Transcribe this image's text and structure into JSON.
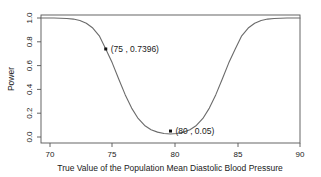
{
  "chart_data": {
    "type": "line",
    "title": "",
    "xlabel": "True Value of the Population Mean Diastolic Blood Pressure",
    "ylabel": "Power",
    "xlim": [
      70,
      90
    ],
    "ylim": [
      0.0,
      1.0
    ],
    "xticks": [
      70,
      75,
      80,
      85,
      90
    ],
    "xticklabels": [
      "70",
      "75",
      "80",
      "85",
      "90"
    ],
    "yticks": [
      0.0,
      0.2,
      0.4,
      0.6,
      0.8,
      1.0
    ],
    "yticklabels": [
      "0.0",
      "0.2",
      "0.4",
      "0.6",
      "0.8",
      "1.0"
    ],
    "grid": false,
    "legend": null,
    "series": [
      {
        "name": "power",
        "color": "#6b6b6b",
        "x": [
          70.0,
          70.5,
          71.0,
          71.5,
          72.0,
          72.5,
          73.0,
          73.5,
          74.0,
          74.5,
          75.0,
          75.5,
          76.0,
          76.5,
          77.0,
          77.5,
          78.0,
          78.5,
          79.0,
          79.5,
          80.0,
          80.5,
          81.0,
          81.5,
          82.0,
          82.5,
          83.0,
          83.5,
          84.0,
          84.5,
          85.0,
          85.5,
          86.0,
          86.5,
          87.0,
          87.5,
          88.0,
          88.5,
          89.0,
          89.5,
          90.0
        ],
        "y": [
          0.9999,
          0.9998,
          0.9994,
          0.9985,
          0.9962,
          0.9909,
          0.9793,
          0.9564,
          0.9155,
          0.8503,
          0.7396,
          0.6232,
          0.488,
          0.356,
          0.2428,
          0.1559,
          0.0968,
          0.0615,
          0.041,
          0.0297,
          0.025,
          0.0297,
          0.041,
          0.0615,
          0.0968,
          0.1559,
          0.2428,
          0.356,
          0.488,
          0.6232,
          0.7396,
          0.8503,
          0.9155,
          0.9564,
          0.9793,
          0.9909,
          0.9962,
          0.9985,
          0.9994,
          0.9998,
          0.9999
        ]
      }
    ],
    "annotations": [
      {
        "x": 75,
        "y": 0.7396,
        "label": "(75 , 0.7396)",
        "marker": "square"
      },
      {
        "x": 80,
        "y": 0.05,
        "label": "(80 , 0.05)",
        "marker": "square"
      }
    ]
  }
}
